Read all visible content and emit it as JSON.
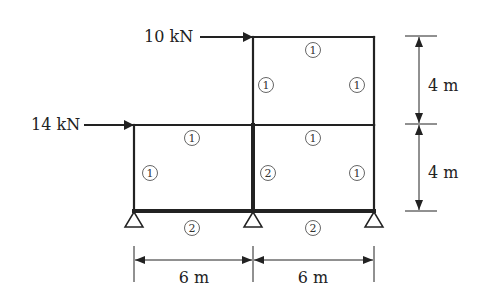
{
  "diagram": {
    "type": "plane-frame",
    "loads": [
      {
        "label": "10 kN",
        "direction": "right",
        "level": "roof"
      },
      {
        "label": "14 kN",
        "direction": "right",
        "level": "first-floor"
      }
    ],
    "member_labels": {
      "upper_beam": "1",
      "upper_left_column": "1",
      "upper_right_column": "1",
      "lower_left_beam": "1",
      "lower_right_beam": "1",
      "lower_left_column": "1",
      "lower_middle_column": "2",
      "lower_right_column": "1",
      "ground_left_beam": "2",
      "ground_right_beam": "2"
    },
    "dimensions": {
      "horizontal": [
        "6 m",
        "6 m"
      ],
      "vertical": [
        "4 m",
        "4 m"
      ]
    },
    "supports": [
      "pin",
      "pin",
      "pin"
    ]
  },
  "colors": {
    "line": "#222222",
    "circle": "#555555"
  }
}
